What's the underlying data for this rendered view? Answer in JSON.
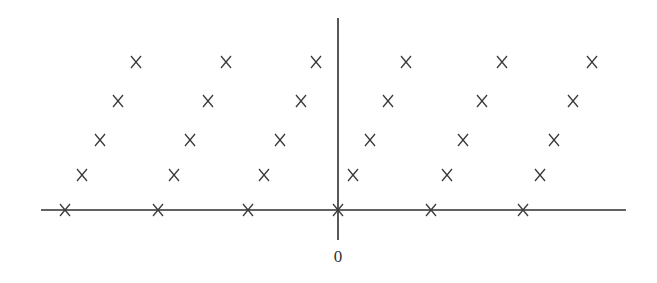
{
  "diagram": {
    "type": "lattice-point-diagram",
    "colors": {
      "ink": "#2e2e2e",
      "background": "#ffffff"
    },
    "origin_label": "0",
    "marker_glyph": "x-cross",
    "axes": {
      "horizontal": {
        "x1": 41,
        "x2": 626,
        "y": 210
      },
      "vertical": {
        "x": 338,
        "y1": 18,
        "y2": 240
      }
    },
    "rows": [
      {
        "row": 0,
        "y": 210,
        "xs": [
          65,
          158,
          248,
          338,
          431,
          523
        ]
      },
      {
        "row": 1,
        "y": 175,
        "xs": [
          82,
          174,
          264,
          353,
          447,
          540
        ]
      },
      {
        "row": 2,
        "y": 140,
        "xs": [
          100,
          190,
          280,
          370,
          463,
          554
        ]
      },
      {
        "row": 3,
        "y": 101,
        "xs": [
          118,
          208,
          301,
          388,
          482,
          573
        ]
      },
      {
        "row": 4,
        "y": 62,
        "xs": [
          136,
          226,
          316,
          406,
          502,
          592
        ]
      }
    ],
    "marker_half_size": 5
  }
}
